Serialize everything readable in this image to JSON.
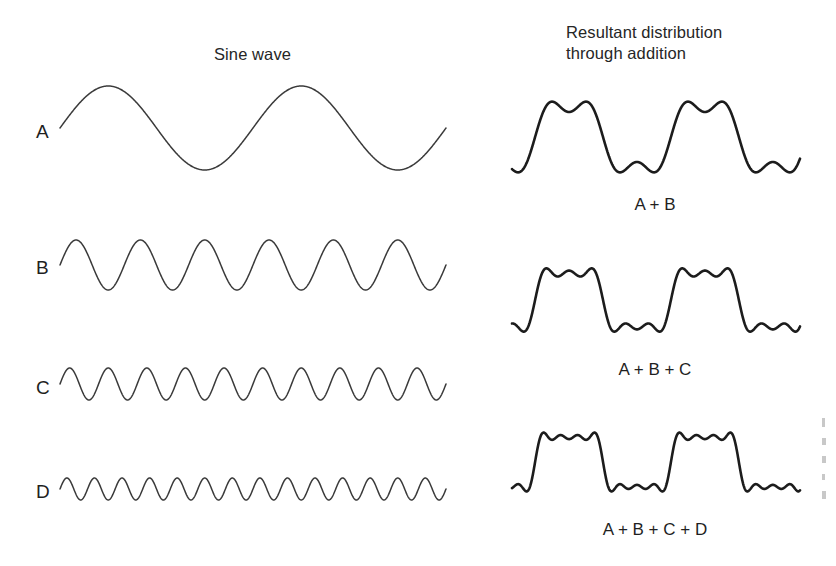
{
  "figure": {
    "background_color": "#ffffff",
    "line_color": "#3a3a3a",
    "sum_line_color": "#1c1c1c",
    "width": 836,
    "height": 566
  },
  "headings": {
    "left": "Sine wave",
    "right": "Resultant distribution\nthrough addition"
  },
  "components": [
    {
      "label": "A",
      "cycles": 2,
      "amplitude": 42,
      "harmonic": 1
    },
    {
      "label": "B",
      "cycles": 6,
      "amplitude": 25,
      "harmonic": 3
    },
    {
      "label": "C",
      "cycles": 10,
      "amplitude": 16,
      "harmonic": 5
    },
    {
      "label": "D",
      "cycles": 14,
      "amplitude": 11,
      "harmonic": 7
    }
  ],
  "sums": [
    {
      "label": "A + B",
      "terms": [
        "A",
        "B"
      ],
      "harmonics": [
        1,
        3
      ]
    },
    {
      "label": "A + B + C",
      "terms": [
        "A",
        "B",
        "C"
      ],
      "harmonics": [
        1,
        3,
        5
      ]
    },
    {
      "label": "A + B + C + D",
      "terms": [
        "A",
        "B",
        "C",
        "D"
      ],
      "harmonics": [
        1,
        3,
        5,
        7
      ]
    }
  ],
  "chart_data": {
    "type": "line",
    "title": "Sine wave",
    "subtitle": "Resultant distribution through addition",
    "xlabel": "",
    "ylabel": "",
    "grid": false,
    "legend": "none",
    "series": [
      {
        "name": "A",
        "harmonic": 1,
        "cycles": 2,
        "relative_amplitude": 1.0,
        "panel": "left"
      },
      {
        "name": "B",
        "harmonic": 3,
        "cycles": 6,
        "relative_amplitude": 0.6,
        "panel": "left"
      },
      {
        "name": "C",
        "harmonic": 5,
        "cycles": 10,
        "relative_amplitude": 0.38,
        "panel": "left"
      },
      {
        "name": "D",
        "harmonic": 7,
        "cycles": 14,
        "relative_amplitude": 0.26,
        "panel": "left"
      },
      {
        "name": "A + B",
        "harmonics": [
          1,
          3
        ],
        "panel": "right"
      },
      {
        "name": "A + B + C",
        "harmonics": [
          1,
          3,
          5
        ],
        "panel": "right"
      },
      {
        "name": "A + B + C + D",
        "harmonics": [
          1,
          3,
          5,
          7
        ],
        "panel": "right"
      }
    ]
  }
}
